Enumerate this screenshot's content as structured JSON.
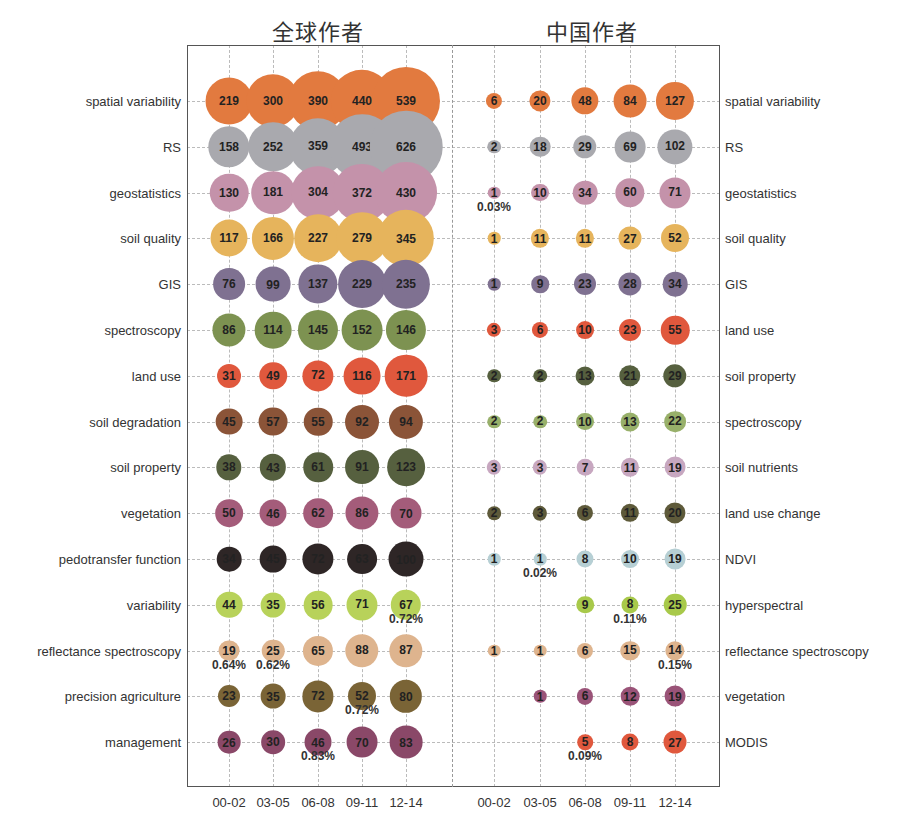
{
  "chart_data": {
    "type": "bubble-matrix",
    "x_categories": [
      "00-02",
      "03-05",
      "06-08",
      "09-11",
      "12-14"
    ],
    "panels": [
      {
        "title": "全球作者",
        "label_side": "left",
        "rows": [
          {
            "keyword": "spatial variability",
            "values": [
              219,
              300,
              390,
              440,
              539
            ],
            "color": "#e27a3f"
          },
          {
            "keyword": "RS",
            "values": [
              158,
              252,
              359,
              493,
              626
            ],
            "color": "#a9a9ae"
          },
          {
            "keyword": "geostatistics",
            "values": [
              130,
              181,
              304,
              372,
              430
            ],
            "color": "#c492aa"
          },
          {
            "keyword": "soil quality",
            "values": [
              117,
              166,
              227,
              279,
              345
            ],
            "color": "#e6b45c"
          },
          {
            "keyword": "GIS",
            "values": [
              76,
              99,
              137,
              229,
              235
            ],
            "color": "#7f7191"
          },
          {
            "keyword": "spectroscopy",
            "values": [
              86,
              114,
              145,
              152,
              146
            ],
            "color": "#7d9251"
          },
          {
            "keyword": "land use",
            "values": [
              31,
              49,
              72,
              116,
              171
            ],
            "color": "#e0583d"
          },
          {
            "keyword": "soil degradation",
            "values": [
              45,
              57,
              55,
              92,
              94
            ],
            "color": "#8b5438"
          },
          {
            "keyword": "soil property",
            "values": [
              38,
              43,
              61,
              91,
              123
            ],
            "color": "#56603f"
          },
          {
            "keyword": "vegetation",
            "values": [
              50,
              46,
              62,
              86,
              70
            ],
            "color": "#a45c7a"
          },
          {
            "keyword": "pedotransfer function",
            "values": [
              34,
              45,
              72,
              63,
              100
            ],
            "color": "#2e2626"
          },
          {
            "keyword": "variability",
            "values": [
              44,
              35,
              56,
              71,
              67
            ],
            "color": "#b8d25a"
          },
          {
            "keyword": "reflectance spectroscopy",
            "values": [
              19,
              25,
              65,
              88,
              87
            ],
            "color": "#deb48e"
          },
          {
            "keyword": "precision agriculture",
            "values": [
              23,
              35,
              72,
              52,
              80
            ],
            "color": "#7a6436"
          },
          {
            "keyword": "management",
            "values": [
              26,
              30,
              46,
              70,
              83
            ],
            "color": "#8a4868"
          }
        ],
        "annotations": [
          {
            "row": 11,
            "col": 4,
            "text": "0.72%"
          },
          {
            "row": 12,
            "col": 0,
            "text": "0.64%"
          },
          {
            "row": 12,
            "col": 1,
            "text": "0.62%"
          },
          {
            "row": 13,
            "col": 3,
            "text": "0.72%"
          },
          {
            "row": 14,
            "col": 2,
            "text": "0.83%"
          }
        ]
      },
      {
        "title": "中国作者",
        "label_side": "right",
        "rows": [
          {
            "keyword": "spatial variability",
            "values": [
              6,
              20,
              48,
              84,
              127
            ],
            "color": "#e27a3f"
          },
          {
            "keyword": "RS",
            "values": [
              2,
              18,
              29,
              69,
              102
            ],
            "color": "#a9a9ae"
          },
          {
            "keyword": "geostatistics",
            "values": [
              1,
              10,
              34,
              60,
              71
            ],
            "color": "#c492aa"
          },
          {
            "keyword": "soil quality",
            "values": [
              1,
              11,
              11,
              27,
              52
            ],
            "color": "#e6b45c"
          },
          {
            "keyword": "GIS",
            "values": [
              1,
              9,
              23,
              28,
              34
            ],
            "color": "#7f7191"
          },
          {
            "keyword": "land use",
            "values": [
              3,
              6,
              10,
              23,
              55
            ],
            "color": "#e0583d"
          },
          {
            "keyword": "soil property",
            "values": [
              2,
              2,
              13,
              21,
              29
            ],
            "color": "#56603f"
          },
          {
            "keyword": "spectroscopy",
            "values": [
              2,
              2,
              10,
              13,
              22
            ],
            "color": "#98b06a"
          },
          {
            "keyword": "soil nutrients",
            "values": [
              3,
              3,
              7,
              11,
              19
            ],
            "color": "#c7a7c0"
          },
          {
            "keyword": "land use change",
            "values": [
              2,
              3,
              6,
              11,
              20
            ],
            "color": "#5e5a3a"
          },
          {
            "keyword": "NDVI",
            "values": [
              1,
              1,
              8,
              10,
              19
            ],
            "color": "#b6cfd4"
          },
          {
            "keyword": "hyperspectral",
            "values": [
              null,
              null,
              9,
              8,
              25
            ],
            "color": "#a8c94a"
          },
          {
            "keyword": "reflectance spectroscopy",
            "values": [
              1,
              1,
              6,
              15,
              14
            ],
            "color": "#deb48e"
          },
          {
            "keyword": "vegetation",
            "values": [
              null,
              1,
              6,
              12,
              19
            ],
            "color": "#9a5378"
          },
          {
            "keyword": "MODIS",
            "values": [
              null,
              null,
              5,
              8,
              27
            ],
            "color": "#e0583d"
          }
        ],
        "annotations": [
          {
            "row": 2,
            "col": 0,
            "text": "0.03%"
          },
          {
            "row": 10,
            "col": 1,
            "text": "0.02%"
          },
          {
            "row": 11,
            "col": 3,
            "text": "0.11%"
          },
          {
            "row": 12,
            "col": 4,
            "text": "0.15%"
          },
          {
            "row": 14,
            "col": 2,
            "text": "0.09%"
          }
        ]
      }
    ],
    "xlabel": "",
    "ylabel": "",
    "grid": true,
    "legend": "none"
  }
}
